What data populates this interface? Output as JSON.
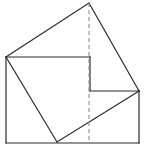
{
  "figure": {
    "title": "",
    "caption": "",
    "background_color": "#ffffff",
    "stroke_color": "#2b2b2b",
    "dashed_stroke_color": "#8f8f8f",
    "stroke_width": 1.2,
    "dash_pattern": "4 3",
    "canvas": {
      "width": 146,
      "height": 165
    },
    "points": {
      "apex_top": {
        "x": 89,
        "y": 3,
        "label": ""
      },
      "left_corner": {
        "x": 6,
        "y": 57,
        "label": ""
      },
      "right_corner": {
        "x": 139,
        "y": 91,
        "label": ""
      },
      "bottom_corner": {
        "x": 57,
        "y": 142,
        "label": ""
      },
      "rect_top_left": {
        "x": 6,
        "y": 57,
        "label": ""
      },
      "rect_bottom_left": {
        "x": 6,
        "y": 143,
        "label": ""
      },
      "rect_bottom_right": {
        "x": 139,
        "y": 143,
        "label": ""
      },
      "step_inner_top": {
        "x": 90,
        "y": 57,
        "label": ""
      },
      "step_inner_bottom": {
        "x": 90,
        "y": 91,
        "label": ""
      },
      "dashed_top": {
        "x": 89,
        "y": 3,
        "label": ""
      },
      "dashed_bottom": {
        "x": 89,
        "y": 143,
        "label": ""
      }
    },
    "segments": [
      {
        "name": "edge-apex-to-left",
        "kind": "solid",
        "from": "89,3",
        "to": "6,57"
      },
      {
        "name": "edge-apex-to-right",
        "kind": "solid",
        "from": "89,3",
        "to": "139,91"
      },
      {
        "name": "edge-left-vertical",
        "kind": "solid",
        "from": "6,57",
        "to": "6,143"
      },
      {
        "name": "edge-bottom-horizontal",
        "kind": "solid",
        "from": "6,143",
        "to": "139,143"
      },
      {
        "name": "edge-right-vertical",
        "kind": "solid",
        "from": "139,143",
        "to": "139,91"
      },
      {
        "name": "edge-top-horizontal-inner",
        "kind": "solid",
        "from": "6,57",
        "to": "90,57"
      },
      {
        "name": "edge-step-vertical-inner",
        "kind": "solid",
        "from": "90,57",
        "to": "90,91"
      },
      {
        "name": "edge-step-horizontal-inner",
        "kind": "solid",
        "from": "90,91",
        "to": "139,91"
      },
      {
        "name": "edge-left-to-bottom-diagonal",
        "kind": "solid",
        "from": "6,57",
        "to": "57,142"
      },
      {
        "name": "edge-bottom-to-right-diagonal",
        "kind": "solid",
        "from": "57,142",
        "to": "139,91"
      },
      {
        "name": "axis-of-symmetry-dashed",
        "kind": "dashed",
        "from": "89,3",
        "to": "89,143"
      }
    ]
  }
}
